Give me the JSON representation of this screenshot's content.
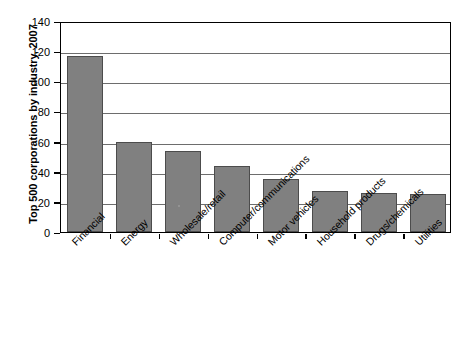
{
  "chart_data": {
    "type": "bar",
    "title": "",
    "xlabel": "",
    "ylabel": "Top 500 corporations by industry, 2007",
    "ylim": [
      0,
      140
    ],
    "ytick_step": 20,
    "yticks": [
      "0",
      "20",
      "40",
      "60",
      "80",
      "100",
      "120",
      "140"
    ],
    "grid": true,
    "legend": "none",
    "bar_color": "#808080",
    "bar_edge_color": "#4c4c4c",
    "axis_color": "#000000",
    "gridline_color": "#6d6d6d",
    "categories": [
      "Financial",
      "Energy",
      "Wholesale/retail",
      "Computer/communications",
      "Motor vehicles",
      "Household products",
      "Drugs/chemicals",
      "Utilities"
    ],
    "values": [
      117,
      60,
      54,
      44,
      35,
      27,
      26,
      25
    ]
  }
}
